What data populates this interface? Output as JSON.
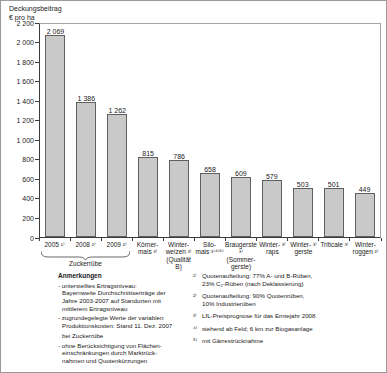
{
  "chart_data": {
    "type": "bar",
    "title": "Deckungsbeitrag",
    "ylabel": "€ pro ha",
    "ylim": [
      0,
      2200
    ],
    "ytick_step": 200,
    "ytick_labels": [
      "0",
      "200",
      "400",
      "600",
      "800",
      "1 000",
      "1 200",
      "1 400",
      "1 600",
      "1 800",
      "2 000",
      "2 200"
    ],
    "categories": [
      "2005 ¹⁾",
      "2008 ²⁾",
      "2009 ²⁾",
      "Körner-\nmais ³⁾",
      "Winter-\nweizen ³⁾\n(Qualität B)",
      "Silo-\nmais ³⁾⁴⁾⁵⁾",
      "Braugerste ³⁾\n(Sommer-\ngerste)",
      "Winter- ³⁾\nraps",
      "Winter- ³⁾\ngerste",
      "Triticale ³⁾",
      "Winter-\nroggen ³⁾"
    ],
    "values": [
      2069,
      1386,
      1262,
      815,
      786,
      658,
      609,
      579,
      503,
      501,
      449
    ],
    "value_labels": [
      "2 069",
      "1 386",
      "1 262",
      "815",
      "786",
      "658",
      "609",
      "579",
      "503",
      "501",
      "449"
    ],
    "group_brace": {
      "label": "Zuckerrübe",
      "from_index": 0,
      "to_index": 2
    },
    "legend": "none",
    "grid": "off"
  },
  "notes": {
    "heading": "Anmerkungen",
    "left_items": [
      "- unterstelltes Ertragsniveau:\nBayernweite Durchschnittserträge der\nJahre 2003-2007 auf Standorten mit\nmittlerem Ertragsniveau",
      "- zugrundegelegte Werte der variablen\nProduktionskosten: Stand 11. Dez. 2007",
      "bei Zuckerrübe",
      "- ohne Berücksichtigung von Flächen-\neinschränkungen durch Marktrück-\nnahmen und Quotenkürzungen"
    ],
    "footnotes": [
      {
        "marker": "¹⁾",
        "text": "Quotenaufteilung: 77% A- und B-Rüben,\n23% C₂-Rüben (nach Deklassierung)"
      },
      {
        "marker": "²⁾",
        "text": "Quotenaufteilung: 90% Quotenrüben,\n10% Industrierüben"
      },
      {
        "marker": "³⁾",
        "text": "LfL-Preisprognose für das Erntejahr 2008"
      },
      {
        "marker": "⁴⁾",
        "text": "stehend ab Feld; 6 km zur Biogasanlage"
      },
      {
        "marker": "⁵⁾",
        "text": "mit Gärrestrücknahme"
      }
    ]
  },
  "colors": {
    "bar_fill": "#c9c9c9",
    "bar_border": "#5f5f5f",
    "axis": "#3c3c3c",
    "frame": "#a6a6a6",
    "text": "#1a1a1a",
    "background": "#ffffff"
  }
}
